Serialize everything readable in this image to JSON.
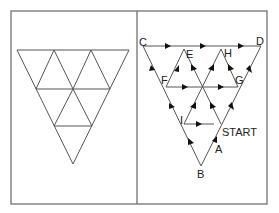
{
  "figure": {
    "left_panel": {
      "description": "Inverted triangle subdivided into six small triangles (trapezoid top row of 5 + 1 bottom)"
    },
    "right_panel": {
      "labels": {
        "C": "C",
        "D": "D",
        "E": "E",
        "F": "F",
        "G": "G",
        "H": "H",
        "I": "I",
        "A": "A",
        "B": "B",
        "start": "START"
      }
    },
    "colors": {
      "line": "#555555",
      "arrow": "#111111",
      "frame": "#666666",
      "background": "#ffffff"
    }
  }
}
